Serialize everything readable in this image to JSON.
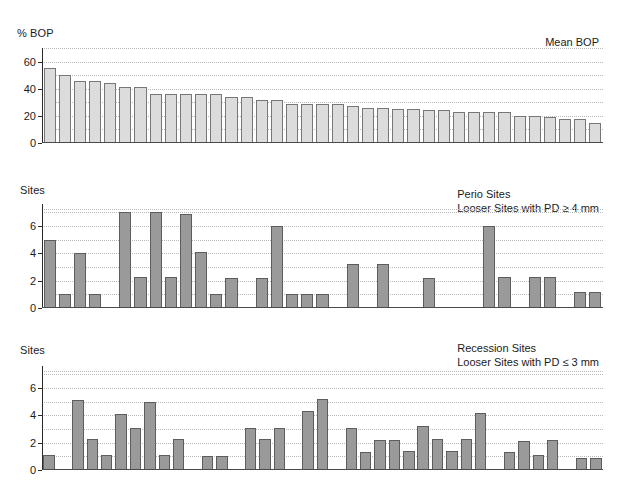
{
  "figure": {
    "panels": [
      {
        "id": "top",
        "y_axis_title": "% BOP",
        "legend_line1": "Mean BOP",
        "legend_line2": ""
      },
      {
        "id": "middle",
        "y_axis_title": "Sites",
        "legend_line1": "Perio Sites",
        "legend_line2": "Looser Sites with PD ≥ 4 mm"
      },
      {
        "id": "bottom",
        "y_axis_title": "Sites",
        "legend_line1": "Recession Sites",
        "legend_line2": "Looser Sites with PD ≤ 3 mm"
      }
    ]
  },
  "chart_data": [
    {
      "type": "bar",
      "title": "Mean BOP",
      "xlabel": "",
      "ylabel": "% BOP",
      "ylim": [
        0,
        70
      ],
      "yticks": [
        0,
        20,
        40,
        60
      ],
      "ytick_labels": [
        "0",
        "20",
        "40",
        "60"
      ],
      "grid": true,
      "legend_position": "top-right",
      "bar_color": "#dcdcdc",
      "bar_edge_color": "#777777",
      "categories": [
        "1",
        "2",
        "3",
        "4",
        "5",
        "6",
        "7",
        "8",
        "9",
        "10",
        "11",
        "12",
        "13",
        "14",
        "15",
        "16",
        "17",
        "18",
        "19",
        "20",
        "21",
        "22",
        "23",
        "24",
        "25",
        "26",
        "27",
        "28",
        "29",
        "30",
        "31",
        "32",
        "33",
        "34",
        "35",
        "36",
        "37"
      ],
      "values": [
        55,
        50,
        46,
        46,
        44,
        41,
        41,
        36,
        36,
        36,
        36,
        36,
        34,
        34,
        32,
        32,
        29,
        29,
        29,
        29,
        27,
        26,
        26,
        25,
        25,
        24,
        24,
        23,
        23,
        23,
        23,
        20,
        20,
        19,
        18,
        18,
        15
      ]
    },
    {
      "type": "bar",
      "title": "Perio Sites",
      "subtitle": "Looser Sites with PD ≥ 4 mm",
      "xlabel": "",
      "ylabel": "Sites",
      "ylim": [
        0,
        7.6
      ],
      "yticks": [
        0,
        2,
        4,
        6
      ],
      "ytick_labels": [
        "0",
        "2",
        "4",
        "6"
      ],
      "grid": true,
      "legend_position": "top-right",
      "bar_color": "#9a9a9a",
      "bar_edge_color": "#5d5d5d",
      "categories": [
        "1",
        "2",
        "3",
        "4",
        "5",
        "6",
        "7",
        "8",
        "9",
        "10",
        "11",
        "12",
        "13",
        "14",
        "15",
        "16",
        "17",
        "18",
        "19",
        "20",
        "21",
        "22",
        "23",
        "24",
        "25",
        "26",
        "27",
        "28",
        "29",
        "30",
        "31",
        "32",
        "33",
        "34",
        "35",
        "36",
        "37"
      ],
      "values": [
        5,
        1,
        4,
        1,
        0,
        7,
        2.3,
        7,
        2.3,
        6.9,
        4.1,
        1,
        2.2,
        0,
        2.2,
        6,
        1,
        1,
        1,
        0,
        3.2,
        0,
        3.2,
        0,
        0,
        2.2,
        0,
        0,
        0,
        6,
        2.3,
        0,
        2.3,
        2.3,
        0,
        1.2,
        1.2
      ]
    },
    {
      "type": "bar",
      "title": "Recession Sites",
      "subtitle": "Looser Sites with PD ≤ 3 mm",
      "xlabel": "",
      "ylabel": "Sites",
      "ylim": [
        0,
        7.6
      ],
      "yticks": [
        0,
        2,
        4,
        6
      ],
      "ytick_labels": [
        "0",
        "2",
        "4",
        "6"
      ],
      "grid": true,
      "legend_position": "top-right",
      "bar_color": "#9a9a9a",
      "bar_edge_color": "#5d5d5d",
      "categories": [
        "1",
        "2",
        "3",
        "4",
        "5",
        "6",
        "7",
        "8",
        "9",
        "10",
        "11",
        "12",
        "13",
        "14",
        "15",
        "16",
        "17",
        "18",
        "19",
        "20",
        "21",
        "22",
        "23",
        "24",
        "25",
        "26",
        "27",
        "28",
        "29",
        "30",
        "31",
        "32",
        "33",
        "34",
        "35",
        "36",
        "37"
      ],
      "values": [
        1.1,
        0,
        5.1,
        2.3,
        1.1,
        4.1,
        3.1,
        5,
        1.1,
        2.3,
        0,
        1,
        1,
        0,
        3.1,
        2.3,
        3.1,
        0,
        4.3,
        5.2,
        0,
        3.1,
        1.3,
        2.2,
        2.2,
        1.4,
        3.2,
        2.3,
        1.4,
        2.3,
        4.2,
        0,
        1.3,
        2.1,
        1.1,
        2.2,
        0,
        0.9,
        0.9
      ]
    }
  ]
}
